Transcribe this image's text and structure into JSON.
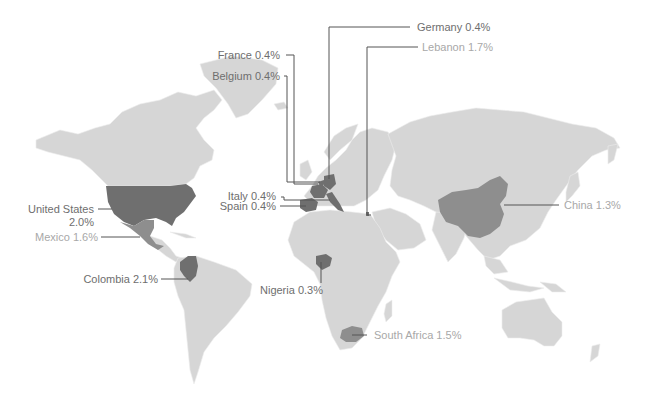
{
  "map": {
    "colors": {
      "land": "#d6d6d6",
      "land_border": "#eeeeee",
      "highlight_dark": "#6f6f6f",
      "highlight_mid": "#8e8e8e",
      "leader_line": "#555555",
      "label_dark": "#6e6e6e",
      "label_light": "#a8a8a8",
      "background": "#ffffff"
    },
    "labels": [
      {
        "id": "germany",
        "text": "Germany 0.4%",
        "tone": "dark"
      },
      {
        "id": "lebanon",
        "text": "Lebanon 1.7%",
        "tone": "light"
      },
      {
        "id": "france",
        "text": "France 0.4%",
        "tone": "dark"
      },
      {
        "id": "belgium",
        "text": "Belgium 0.4%",
        "tone": "dark"
      },
      {
        "id": "italy",
        "text": "Italy 0.4%",
        "tone": "dark"
      },
      {
        "id": "spain",
        "text": "Spain 0.4%",
        "tone": "dark"
      },
      {
        "id": "united_states_line1",
        "text": "United States",
        "tone": "dark"
      },
      {
        "id": "united_states_line2",
        "text": "2.0%",
        "tone": "dark"
      },
      {
        "id": "mexico",
        "text": "Mexico 1.6%",
        "tone": "light"
      },
      {
        "id": "colombia",
        "text": "Colombia 2.1%",
        "tone": "dark"
      },
      {
        "id": "nigeria",
        "text": "Nigeria 0.3%",
        "tone": "dark"
      },
      {
        "id": "south_africa",
        "text": "South Africa 1.5%",
        "tone": "light"
      },
      {
        "id": "china",
        "text": "China 1.3%",
        "tone": "light"
      }
    ]
  }
}
